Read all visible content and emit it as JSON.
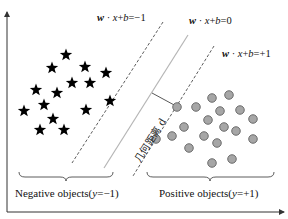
{
  "diagram": {
    "hyperplanes": {
      "negative_margin": {
        "prefix": "w",
        "dot": " · ",
        "x": "x",
        "plus": "+",
        "b": "b",
        "rhs": "=−1"
      },
      "decision_boundary": {
        "prefix": "w",
        "dot": " · ",
        "x": "x",
        "plus": "+",
        "b": "b",
        "rhs": "=0"
      },
      "positive_margin": {
        "prefix": "w",
        "dot": " · ",
        "x": "x",
        "plus": "+",
        "b": "b",
        "rhs": "=+1"
      }
    },
    "distance_label": "几何距离 d",
    "negative_group": {
      "label_prefix": "Negative objects(",
      "label_var": "y",
      "label_suffix": "=−1)",
      "marker": "star",
      "count": 15
    },
    "positive_group": {
      "label_prefix": "Positive objects(",
      "label_var": "y",
      "label_suffix": "=+1)",
      "marker": "circle",
      "count": 19
    },
    "colors": {
      "star": "#000000",
      "circle_fill": "#a6a6a6",
      "circle_stroke": "#555555",
      "boundary": "#b5b5b5",
      "margin": "#333333",
      "axis": "#333333"
    },
    "negative_points": [
      [
        0.66,
        0.55
      ],
      [
        0.52,
        0.68
      ],
      [
        0.85,
        0.67
      ],
      [
        1.06,
        0.73
      ],
      [
        0.72,
        0.83
      ],
      [
        0.9,
        0.83
      ],
      [
        0.36,
        0.9
      ],
      [
        0.57,
        0.93
      ],
      [
        0.24,
        1.11
      ],
      [
        0.44,
        1.05
      ],
      [
        0.86,
        1.1
      ],
      [
        1.1,
        1.01
      ],
      [
        0.53,
        1.19
      ],
      [
        0.4,
        1.3
      ],
      [
        0.64,
        1.3
      ]
    ],
    "positive_points": [
      [
        1.77,
        1.07
      ],
      [
        1.96,
        1.07
      ],
      [
        2.12,
        0.98
      ],
      [
        2.29,
        0.95
      ],
      [
        2.2,
        1.11
      ],
      [
        2.4,
        1.1
      ],
      [
        2.53,
        1.19
      ],
      [
        2.08,
        1.2
      ],
      [
        1.84,
        1.27
      ],
      [
        2.24,
        1.27
      ],
      [
        2.36,
        1.31
      ],
      [
        1.56,
        1.39
      ],
      [
        1.72,
        1.36
      ],
      [
        2.04,
        1.36
      ],
      [
        2.17,
        1.43
      ],
      [
        2.53,
        1.39
      ],
      [
        1.89,
        1.48
      ],
      [
        2.12,
        1.63
      ],
      [
        2.32,
        1.59
      ]
    ]
  }
}
